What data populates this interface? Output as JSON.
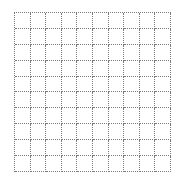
{
  "grid": {
    "rows": 10,
    "columns": 10,
    "line_color": "#7a7a7a",
    "line_style": "dotted",
    "background": "#ffffff"
  }
}
